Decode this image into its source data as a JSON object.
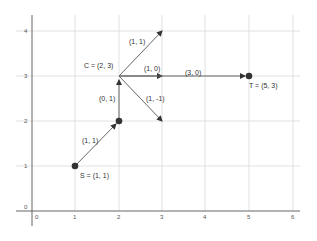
{
  "diagram": {
    "type": "vector-path-plot",
    "axes": {
      "x_ticks": [
        "0",
        "1",
        "2",
        "3",
        "4",
        "5",
        "6"
      ],
      "y_ticks": [
        "0",
        "1",
        "2",
        "3",
        "4"
      ],
      "xlim": [
        0,
        6
      ],
      "ylim": [
        0,
        4
      ]
    },
    "points": [
      {
        "id": "S",
        "label": "S = (1, 1)",
        "x": 1,
        "y": 1
      },
      {
        "id": "P",
        "label": "",
        "x": 2,
        "y": 2
      },
      {
        "id": "C",
        "label": "C = (2, 3)",
        "x": 2,
        "y": 3
      },
      {
        "id": "T",
        "label": "T = (5, 3)",
        "x": 5,
        "y": 3
      }
    ],
    "vectors": [
      {
        "label": "(1, 1)",
        "from": [
          1,
          1
        ],
        "to": [
          2,
          2
        ]
      },
      {
        "label": "(0, 1)",
        "from": [
          2,
          2
        ],
        "to": [
          2,
          3
        ]
      },
      {
        "label": "(1, 1)",
        "from": [
          2,
          3
        ],
        "to": [
          3,
          4
        ]
      },
      {
        "label": "(1, 0)",
        "from": [
          2,
          3
        ],
        "to": [
          3,
          3
        ]
      },
      {
        "label": "(1, -1)",
        "from": [
          2,
          3
        ],
        "to": [
          3,
          2
        ]
      },
      {
        "label": "(3, 0)",
        "from": [
          2,
          3
        ],
        "to": [
          5,
          3
        ]
      }
    ],
    "colors": {
      "grid": "#d9d9d9",
      "axis": "#555555",
      "vector": "#555555",
      "point": "#333333",
      "text": "#333333"
    }
  }
}
